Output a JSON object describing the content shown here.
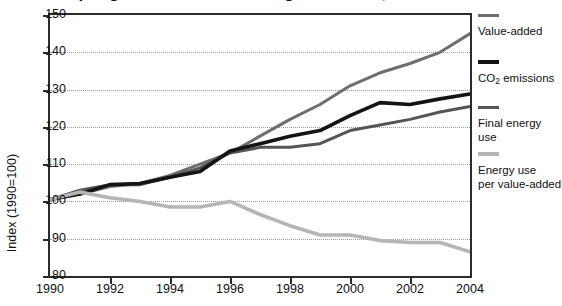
{
  "figure": {
    "title_partial": "Decoupling in the manufacturing industries, EU-15",
    "title_clipped": true
  },
  "axes": {
    "ylabel": "Index (1990=100)",
    "yticks": [
      80,
      90,
      100,
      110,
      120,
      130,
      140,
      150
    ],
    "ylim": [
      80,
      150
    ],
    "xticks": [
      1990,
      1992,
      1994,
      1996,
      1998,
      2000,
      2002,
      2004
    ],
    "xlim": [
      1990,
      2004
    ],
    "grid": "horizontal-dotted"
  },
  "legend": {
    "position": "right",
    "entries": [
      {
        "label": "Value-added",
        "color": "#6e6e6e",
        "thickness": 3
      },
      {
        "label": "CO₂ emissions",
        "color": "#141414",
        "thickness": 4
      },
      {
        "label": "Final energy use",
        "color": "#555555",
        "thickness": 3
      },
      {
        "label": "Energy use\nper value-added",
        "color": "#b5b5b5",
        "thickness": 4
      }
    ]
  },
  "chart_data": {
    "type": "line",
    "title": "Decoupling in the manufacturing industries, EU-15",
    "xlabel": "",
    "ylabel": "Index (1990=100)",
    "xlim": [
      1990,
      2004
    ],
    "ylim": [
      80,
      150
    ],
    "grid": true,
    "legend_position": "right",
    "x": [
      1990,
      1991,
      1992,
      1993,
      1994,
      1995,
      1996,
      1997,
      1998,
      1999,
      2000,
      2001,
      2002,
      2003,
      2004
    ],
    "series": [
      {
        "name": "Value-added",
        "color": "#6e6e6e",
        "values": [
          100.5,
          102.0,
          104.0,
          104.8,
          107.0,
          110.0,
          113.0,
          117.5,
          122.0,
          126.0,
          131.0,
          134.5,
          137.0,
          140.0,
          145.0
        ]
      },
      {
        "name": "CO₂ emissions",
        "color": "#141414",
        "values": [
          100.5,
          102.0,
          104.5,
          104.8,
          106.5,
          108.0,
          113.5,
          115.5,
          117.5,
          119.0,
          123.0,
          126.5,
          126.0,
          127.5,
          128.8
        ]
      },
      {
        "name": "Final energy use",
        "color": "#555555",
        "values": [
          100.5,
          103.0,
          104.5,
          104.5,
          106.5,
          109.0,
          113.0,
          114.5,
          114.5,
          115.5,
          119.0,
          120.5,
          122.0,
          124.0,
          125.5
        ]
      },
      {
        "name": "Energy use per value-added",
        "color": "#b5b5b5",
        "values": [
          100.5,
          102.5,
          101.0,
          100.0,
          98.5,
          98.5,
          100.0,
          96.5,
          93.5,
          91.0,
          91.0,
          89.5,
          89.0,
          89.0,
          86.5
        ]
      }
    ]
  }
}
